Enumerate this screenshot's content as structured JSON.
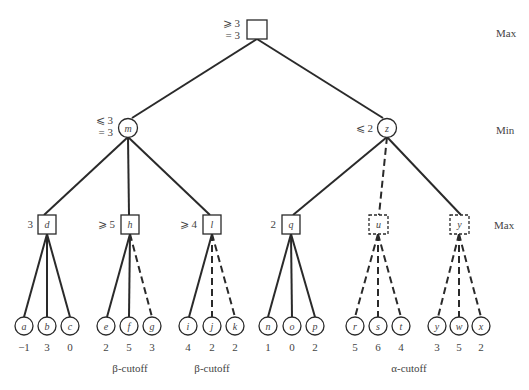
{
  "level_labels": {
    "max_top": "Max",
    "min": "Min",
    "max_bottom": "Max"
  },
  "root": {
    "label": "",
    "bound1": "⩾ 3",
    "bound2": "= 3"
  },
  "min_nodes": [
    {
      "id": "m",
      "bound1": "⩽ 3",
      "bound2": "= 3"
    },
    {
      "id": "z",
      "bound1": "⩽ 2",
      "bound2": ""
    }
  ],
  "max_nodes": [
    {
      "id": "d",
      "value": "3",
      "dashed": false
    },
    {
      "id": "h",
      "value": "⩾ 5",
      "dashed": false
    },
    {
      "id": "l",
      "value": "⩾ 4",
      "dashed": false
    },
    {
      "id": "q",
      "value": "2",
      "dashed": false
    },
    {
      "id": "u",
      "value": "",
      "dashed": true
    },
    {
      "id": "y",
      "value": "",
      "dashed": true
    }
  ],
  "leaves": [
    {
      "id": "a",
      "value": "−1",
      "dashed": false
    },
    {
      "id": "b",
      "value": "3",
      "dashed": false
    },
    {
      "id": "c",
      "value": "0",
      "dashed": false
    },
    {
      "id": "e",
      "value": "2",
      "dashed": false
    },
    {
      "id": "f",
      "value": "5",
      "dashed": false
    },
    {
      "id": "g",
      "value": "3",
      "dashed": true
    },
    {
      "id": "i",
      "value": "4",
      "dashed": false
    },
    {
      "id": "j",
      "value": "2",
      "dashed": true
    },
    {
      "id": "k",
      "value": "2",
      "dashed": true
    },
    {
      "id": "n",
      "value": "1",
      "dashed": false
    },
    {
      "id": "o",
      "value": "0",
      "dashed": false
    },
    {
      "id": "p",
      "value": "2",
      "dashed": false
    },
    {
      "id": "r",
      "value": "5",
      "dashed": true
    },
    {
      "id": "s",
      "value": "6",
      "dashed": true
    },
    {
      "id": "t",
      "value": "4",
      "dashed": true
    },
    {
      "id": "y",
      "value": "3",
      "dashed": true
    },
    {
      "id": "w",
      "value": "5",
      "dashed": true
    },
    {
      "id": "x",
      "value": "2",
      "dashed": true
    }
  ],
  "cutoffs": [
    {
      "label": "β-cutoff",
      "under": "h"
    },
    {
      "label": "β-cutoff",
      "under": "l"
    },
    {
      "label": "α-cutoff",
      "under": "u"
    }
  ]
}
